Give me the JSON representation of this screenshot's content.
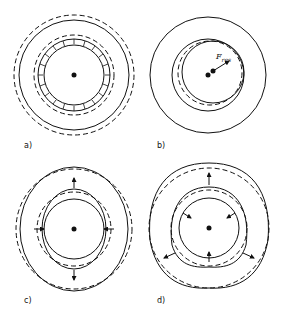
{
  "figure": {
    "panels": [
      {
        "id": "a",
        "label": "a)",
        "description": "Concentric rings with inward radial arrows uniformly distributed on inner ring (uniform radial load)"
      },
      {
        "id": "b",
        "label": "b)",
        "description": "Inner ring offset eccentrically; resultant force arrow",
        "force_label": "F",
        "force_subscript": "res"
      },
      {
        "id": "c",
        "label": "c)",
        "description": "Ovalized ring deformation with two outward and two inward arrows"
      },
      {
        "id": "d",
        "label": "d)",
        "description": "Triangular (three-lobe) deformation with three outward and three inward arrows"
      }
    ]
  }
}
